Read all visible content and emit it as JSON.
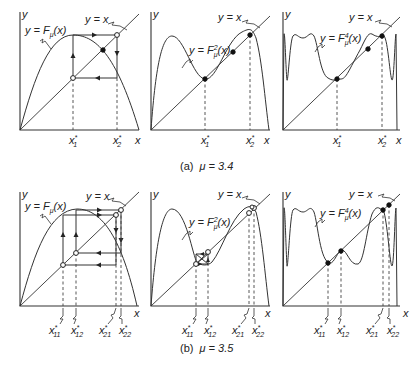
{
  "figure": {
    "rows": [
      {
        "caption_prefix": "(a)",
        "caption_mu": "μ = 3.4",
        "panels": [
          {
            "curve_label": "y = F",
            "curve_sub": "μ",
            "curve_sup": "",
            "curve_arg": "(x)",
            "diag_label": "y = x",
            "y_axis": "y",
            "x_axis": "x",
            "ticks": [
              {
                "base": "x",
                "sup": "*",
                "sub": "1"
              },
              {
                "base": "x",
                "sup": "*",
                "sub": "2"
              }
            ]
          },
          {
            "curve_label": "y = F",
            "curve_sub": "μ",
            "curve_sup": "2",
            "curve_arg": "(x)",
            "diag_label": "y = x",
            "y_axis": "y",
            "x_axis": "x",
            "ticks": [
              {
                "base": "x",
                "sup": "*",
                "sub": "1"
              },
              {
                "base": "x",
                "sup": "*",
                "sub": "2"
              }
            ]
          },
          {
            "curve_label": "y = F",
            "curve_sub": "μ",
            "curve_sup": "4",
            "curve_arg": "(x)",
            "diag_label": "y = x",
            "y_axis": "y",
            "x_axis": "x",
            "ticks": [
              {
                "base": "x",
                "sup": "*",
                "sub": "1"
              },
              {
                "base": "x",
                "sup": "*",
                "sub": "2"
              }
            ]
          }
        ]
      },
      {
        "caption_prefix": "(b)",
        "caption_mu": "μ = 3.5",
        "panels": [
          {
            "curve_label": "y = F",
            "curve_sub": "μ",
            "curve_sup": "",
            "curve_arg": "(x)",
            "diag_label": "y = x",
            "y_axis": "y",
            "x_axis": "x",
            "ticks": [
              {
                "base": "x",
                "sup": "*",
                "sub": "11"
              },
              {
                "base": "x",
                "sup": "*",
                "sub": "12"
              },
              {
                "base": "x",
                "sup": "*",
                "sub": "21"
              },
              {
                "base": "x",
                "sup": "*",
                "sub": "22"
              }
            ]
          },
          {
            "curve_label": "y = F",
            "curve_sub": "μ",
            "curve_sup": "2",
            "curve_arg": "(x)",
            "diag_label": "y = x",
            "y_axis": "y",
            "x_axis": "x",
            "ticks": [
              {
                "base": "x",
                "sup": "*",
                "sub": "11"
              },
              {
                "base": "x",
                "sup": "*",
                "sub": "12"
              },
              {
                "base": "x",
                "sup": "*",
                "sub": "21"
              },
              {
                "base": "x",
                "sup": "*",
                "sub": "22"
              }
            ]
          },
          {
            "curve_label": "y = F",
            "curve_sub": "μ",
            "curve_sup": "4",
            "curve_arg": "(x)",
            "diag_label": "y = x",
            "y_axis": "y",
            "x_axis": "x",
            "ticks": [
              {
                "base": "x",
                "sup": "*",
                "sub": "11"
              },
              {
                "base": "x",
                "sup": "*",
                "sub": "12"
              },
              {
                "base": "x",
                "sup": "*",
                "sub": "21"
              },
              {
                "base": "x",
                "sup": "*",
                "sub": "22"
              }
            ]
          }
        ]
      }
    ]
  },
  "colors": {
    "ink": "#222222",
    "background": "#ffffff"
  }
}
